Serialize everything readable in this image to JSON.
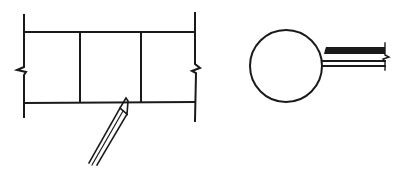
{
  "diagram": {
    "title": "",
    "figures": [
      {
        "id": "wall-section",
        "description": "Three-bay wall section with break lines on both ends and a pointed pencil/stylus touching the bottom line",
        "bays": 3,
        "break_marks": [
          "left",
          "right"
        ],
        "tool": "pencil"
      },
      {
        "id": "round-with-stem",
        "description": "Circle with a double-line stem extending right, terminated by a break line",
        "break_marks": [
          "right"
        ]
      }
    ],
    "stroke_color": "#1a1a1a",
    "background_color": "#ffffff"
  }
}
